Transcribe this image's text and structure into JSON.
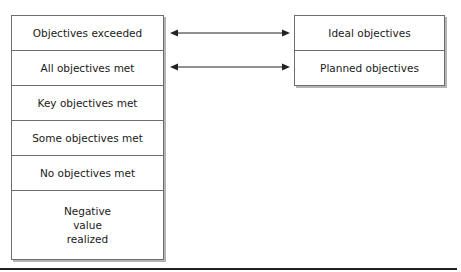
{
  "diagram": {
    "left_column": {
      "items": [
        {
          "label": "Objectives exceeded"
        },
        {
          "label": "All objectives met"
        },
        {
          "label": "Key objectives met"
        },
        {
          "label": "Some objectives met"
        },
        {
          "label": "No objectives met"
        },
        {
          "label": "Negative value realized"
        }
      ]
    },
    "right_column": {
      "items": [
        {
          "label": "Ideal objectives"
        },
        {
          "label": "Planned objectives"
        }
      ]
    },
    "connectors": [
      {
        "from": "Objectives exceeded",
        "to": "Ideal objectives",
        "type": "double-arrow"
      },
      {
        "from": "All objectives met",
        "to": "Planned objectives",
        "type": "double-arrow"
      }
    ],
    "colors": {
      "border": "#6e6e6e",
      "shadow": "#b4b4b4",
      "text": "#1a1a1a",
      "rule": "#222222"
    }
  }
}
